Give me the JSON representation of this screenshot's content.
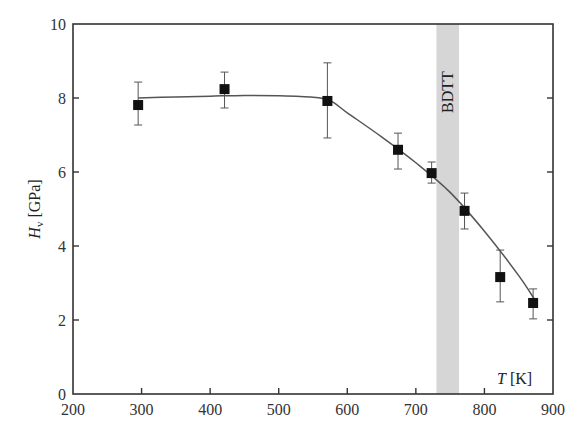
{
  "chart_data": {
    "type": "scatter",
    "title": "",
    "xlabel": "T [K]",
    "ylabel": "H_v [GPa]",
    "ylabel_main": "H",
    "ylabel_sub": "v",
    "ylabel_unit": " [GPa]",
    "xlabel_main": "T",
    "xlabel_unit": " [K]",
    "xlim": [
      200,
      900
    ],
    "ylim": [
      0,
      10
    ],
    "xticks": [
      200,
      300,
      400,
      500,
      600,
      700,
      800,
      900
    ],
    "yticks": [
      0,
      2,
      4,
      6,
      8,
      10
    ],
    "grid": false,
    "legend": null,
    "series": [
      {
        "name": "Vickers hardness",
        "marker": "filled-square",
        "x": [
          295,
          421,
          571,
          674,
          723,
          771,
          823,
          871
        ],
        "y": [
          7.81,
          8.24,
          7.92,
          6.6,
          5.97,
          4.95,
          3.16,
          2.46
        ],
        "yerr_upper": [
          8.43,
          8.7,
          8.95,
          7.05,
          6.27,
          5.43,
          3.89,
          2.84
        ],
        "yerr_lower": [
          7.27,
          7.73,
          6.92,
          6.08,
          5.7,
          4.46,
          2.49,
          2.03
        ]
      },
      {
        "name": "fit curve",
        "type": "line",
        "x": [
          295,
          350,
          400,
          450,
          500,
          550,
          575,
          600,
          650,
          700,
          750,
          800,
          850,
          875
        ],
        "y": [
          8.0,
          8.03,
          8.05,
          8.07,
          8.06,
          8.02,
          7.93,
          7.6,
          6.95,
          6.25,
          5.45,
          4.4,
          3.2,
          2.5
        ]
      }
    ],
    "annotations": [
      {
        "text": "BDTT",
        "type": "shaded-band",
        "x_from": 730,
        "x_to": 763,
        "rotation": -90,
        "color": "#d9d9d9"
      }
    ],
    "colors": {
      "marker": "#111111",
      "line": "#555555",
      "band": "#d6d6d6",
      "axis": "#333333"
    }
  }
}
